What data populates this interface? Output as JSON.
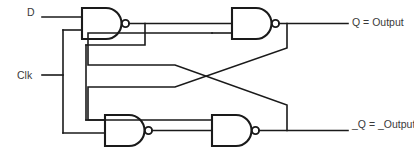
{
  "diagram": {
    "stroke_color": "#1a1a1a",
    "text_color": "#3a3a3a",
    "background": "#ffffff"
  },
  "inputs": [
    {
      "id": "d",
      "label": "D"
    },
    {
      "id": "clk",
      "label": "Clk"
    }
  ],
  "outputs": [
    {
      "id": "q",
      "label": "Q = Output"
    },
    {
      "id": "nq",
      "label": "_Q = _Output"
    }
  ],
  "gates": [
    {
      "id": "nand-top-left",
      "type": "NAND",
      "inputs": 2
    },
    {
      "id": "nand-top-right",
      "type": "NAND",
      "inputs": 2
    },
    {
      "id": "nand-bottom-left",
      "type": "NAND",
      "inputs": 2
    },
    {
      "id": "nand-bottom-right",
      "type": "NAND",
      "inputs": 2
    }
  ]
}
